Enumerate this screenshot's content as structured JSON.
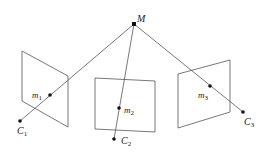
{
  "diagram": {
    "type": "multi-view camera projection",
    "colors": {
      "line": "#555555",
      "point": "#111111",
      "background": "#ffffff"
    },
    "world_point": {
      "label": "M",
      "x": 134,
      "y": 24
    },
    "views": [
      {
        "plane": [
          [
            22,
            51
          ],
          [
            68,
            76
          ],
          [
            68,
            127
          ],
          [
            22,
            101
          ]
        ],
        "image_point": {
          "label": "m",
          "sub": "1",
          "x": 50,
          "y": 95
        },
        "camera": {
          "label": "C",
          "sub": "1",
          "x": 20,
          "y": 121
        }
      },
      {
        "plane": [
          [
            95,
            78
          ],
          [
            155,
            81
          ],
          [
            155,
            132
          ],
          [
            95,
            129
          ]
        ],
        "image_point": {
          "label": "m",
          "sub": "2",
          "x": 119,
          "y": 108
        },
        "camera": {
          "label": "C",
          "sub": "2",
          "x": 114,
          "y": 139
        }
      },
      {
        "plane": [
          [
            178,
            74
          ],
          [
            230,
            60
          ],
          [
            230,
            112
          ],
          [
            178,
            128
          ]
        ],
        "image_point": {
          "label": "m",
          "sub": "3",
          "x": 210,
          "y": 86
        },
        "camera": {
          "label": "C",
          "sub": "3",
          "x": 243,
          "y": 112
        }
      }
    ]
  },
  "labels": {
    "M": "M",
    "m1": "m",
    "m1_sub": "1",
    "m2": "m",
    "m2_sub": "2",
    "m3": "m",
    "m3_sub": "3",
    "C1": "C",
    "C1_sub": "1",
    "C2": "C",
    "C2_sub": "2",
    "C3": "C",
    "C3_sub": "3"
  }
}
